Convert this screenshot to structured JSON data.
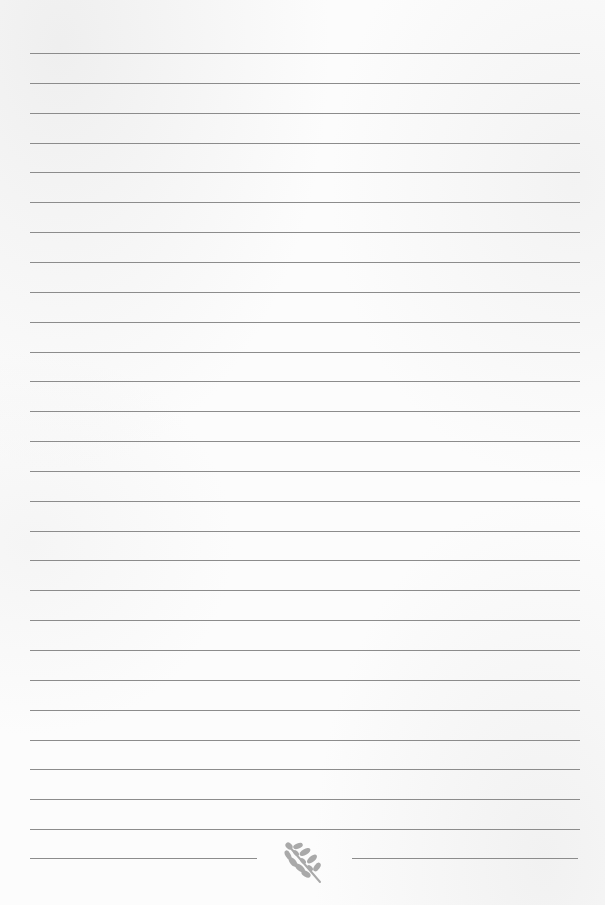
{
  "page": {
    "type": "lined-paper",
    "background_color": "#fbfbfb",
    "line_color": "#8c8c8c"
  },
  "lines": {
    "count": 27,
    "left": 30,
    "right": 580,
    "first_y": 53,
    "spacing": 29.85
  },
  "footer": {
    "line_y": 858,
    "left_segment": {
      "x1": 30,
      "x2": 257
    },
    "right_segment": {
      "x1": 352,
      "x2": 578
    },
    "ornament": {
      "icon": "leaf-icon",
      "color": "#a9a9a9"
    }
  }
}
